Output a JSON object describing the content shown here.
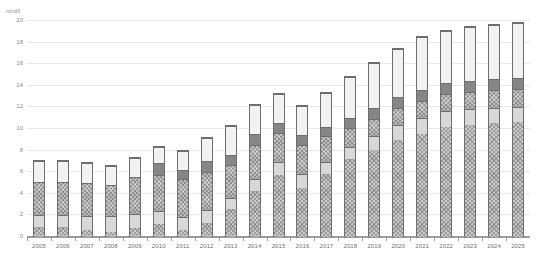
{
  "chart_data": {
    "type": "bar",
    "title": "",
    "subtitle": "",
    "xlabel": "",
    "ylabel": "mrd/l",
    "unit_label": "mrd/l",
    "stacked": true,
    "grid": true,
    "legend_position": "none",
    "ylim": [
      0,
      20
    ],
    "ytick_labels": [
      "0",
      "2",
      "4",
      "6",
      "8",
      "10",
      "12",
      "14",
      "16",
      "18",
      "20"
    ],
    "yticks": [
      0,
      2,
      4,
      6,
      8,
      10,
      12,
      14,
      16,
      18,
      20
    ],
    "categories": [
      "2005",
      "2006",
      "2007",
      "2008",
      "2009",
      "2010",
      "2011",
      "2012",
      "2013",
      "2014",
      "2015",
      "2016",
      "2017",
      "2018",
      "2019",
      "2020",
      "2021",
      "2022",
      "2023",
      "2024",
      "2025"
    ],
    "series": [
      {
        "name": "series-1",
        "color": "#c9c9c9",
        "pattern": "crosshatch-light",
        "values": [
          0.9,
          0.9,
          0.7,
          0.5,
          0.8,
          1.2,
          0.7,
          1.3,
          2.6,
          4.3,
          5.8,
          4.6,
          5.9,
          7.3,
          8.1,
          9.0,
          9.6,
          10.2,
          10.4,
          10.6,
          10.7
        ]
      },
      {
        "name": "series-2",
        "color": "#d8d8d8",
        "pattern": "solid-light",
        "values": [
          1.2,
          1.2,
          1.3,
          1.5,
          1.4,
          1.2,
          1.2,
          1.2,
          1.0,
          1.1,
          1.2,
          1.3,
          1.1,
          1.1,
          1.3,
          1.4,
          1.5,
          1.5,
          1.5,
          1.4,
          1.4
        ]
      },
      {
        "name": "series-3",
        "color": "#8f8f8f",
        "pattern": "crosshatch-dark",
        "values": [
          3.1,
          3.1,
          3.1,
          2.9,
          3.4,
          3.4,
          3.5,
          3.6,
          3.1,
          3.2,
          2.7,
          2.7,
          2.4,
          1.8,
          1.6,
          1.6,
          1.6,
          1.6,
          1.6,
          1.7,
          1.7
        ]
      },
      {
        "name": "series-4",
        "color": "#868686",
        "pattern": "solid-mid",
        "values": [
          0.0,
          0.0,
          0.0,
          0.0,
          0.0,
          1.1,
          0.9,
          1.0,
          1.0,
          1.0,
          0.9,
          0.9,
          0.9,
          0.9,
          1.0,
          1.0,
          1.0,
          1.0,
          1.0,
          1.0,
          1.0
        ]
      },
      {
        "name": "series-5",
        "color": "#f2f2f2",
        "pattern": "solid-white",
        "values": [
          1.9,
          1.9,
          1.8,
          1.8,
          1.8,
          1.5,
          1.8,
          2.2,
          2.7,
          2.7,
          2.7,
          2.7,
          3.1,
          3.8,
          4.2,
          4.5,
          4.9,
          4.9,
          5.0,
          5.0,
          5.1
        ]
      }
    ],
    "totals": [
      7.1,
      7.1,
      6.9,
      6.7,
      7.4,
      8.4,
      8.1,
      9.3,
      10.4,
      12.3,
      13.3,
      12.2,
      13.4,
      14.9,
      16.2,
      17.5,
      18.6,
      19.2,
      19.5,
      19.7,
      19.9
    ]
  }
}
